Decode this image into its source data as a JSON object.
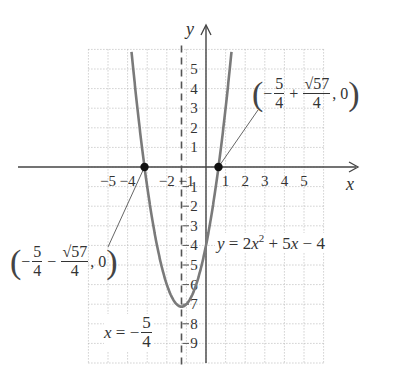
{
  "chart_data": {
    "type": "line",
    "title": "",
    "equation": "y = 2x^2 + 5x - 4",
    "xlabel": "x",
    "ylabel": "y",
    "xlim": [
      -6,
      6
    ],
    "ylim": [
      -10,
      6
    ],
    "grid": true,
    "grid_style": "dotted",
    "x_ticks": [
      -5,
      -4,
      -2,
      -1,
      1,
      2,
      3,
      4,
      5
    ],
    "x_tick_labels": [
      "−5",
      "−4",
      "−2",
      "−1",
      "1",
      "2",
      "3",
      "4",
      "5"
    ],
    "y_ticks": [
      5,
      4,
      3,
      2,
      1,
      -1,
      -2,
      -3,
      -4,
      -5,
      -6,
      -7,
      -8,
      -9
    ],
    "y_tick_labels": [
      "5",
      "4",
      "3",
      "2",
      "1",
      "1",
      "2",
      "3",
      "4",
      "5",
      "6",
      "7",
      "8",
      "9"
    ],
    "series": [
      {
        "name": "y = 2x^2 + 5x - 4",
        "a": 2,
        "b": 5,
        "c": -4,
        "color": "#7a7a7a"
      }
    ],
    "vertex": {
      "x": -1.25,
      "y": -7.125
    },
    "axis_of_symmetry": {
      "x": -1.25,
      "label": "x = −5/4",
      "style": "dashed"
    },
    "points": [
      {
        "x": -3.137,
        "y": 0,
        "label": "(−5/4 − √57/4, 0)"
      },
      {
        "x": 0.637,
        "y": 0,
        "label": "(−5/4 + √57/4, 0)"
      }
    ]
  },
  "labels": {
    "x_axis": "x",
    "y_axis": "y",
    "equation": {
      "lhs": "y",
      "rhs_1": "= 2",
      "var": "x",
      "exp": "2",
      "rhs_2": " + 5",
      "var2": "x",
      "rhs_3": " − 4"
    },
    "symmetry": {
      "lhs": "x",
      "eq": " = −",
      "num": "5",
      "den": "4"
    },
    "right_root": {
      "minus": "−",
      "n1": "5",
      "d1": "4",
      "plus": "+",
      "n2": "57",
      "d2": "4",
      "tail": ", 0"
    },
    "left_root": {
      "minus": "−",
      "n1": "5",
      "d1": "4",
      "minus2": "−",
      "n2": "57",
      "d2": "4",
      "tail": ", 0"
    }
  }
}
